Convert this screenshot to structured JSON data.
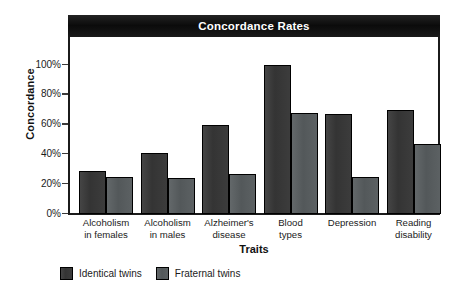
{
  "chart_data": {
    "type": "bar",
    "title": "Concordance Rates",
    "xlabel": "Traits",
    "ylabel": "Concordance",
    "categories": [
      "Alcoholism\nin females",
      "Alcoholism\nin males",
      "Alzheimer's\ndisease",
      "Blood\ntypes",
      "Depression",
      "Reading\ndisability"
    ],
    "category_lines": [
      [
        "Alcoholism",
        "in females"
      ],
      [
        "Alcoholism",
        "in males"
      ],
      [
        "Alzheimer's",
        "disease"
      ],
      [
        "Blood",
        "types"
      ],
      [
        "Depression",
        ""
      ],
      [
        "Reading",
        "disability"
      ]
    ],
    "series": [
      {
        "name": "Identical twins",
        "color": "#3a3a3a",
        "values": [
          29,
          41,
          60,
          100,
          67,
          70
        ]
      },
      {
        "name": "Fraternal twins",
        "color": "#5a5f61",
        "values": [
          25,
          24,
          27,
          68,
          25,
          47
        ]
      }
    ],
    "ylim": [
      0,
      100
    ],
    "ytick_values": [
      100,
      80,
      60,
      40,
      20,
      0
    ],
    "ytick_labels": [
      "100%",
      "80%",
      "60%",
      "40%",
      "20%",
      "0%"
    ],
    "grid": false,
    "legend_position": "bottom-left",
    "value_unit": "%"
  },
  "legend": [
    {
      "label": "Identical twins",
      "color": "#3a3a3a"
    },
    {
      "label": "Fraternal twins",
      "color": "#5a5f61"
    }
  ],
  "colors": {
    "title_bar_background": "#111111",
    "title_text": "#ffffff",
    "axis": "#1b1b1b",
    "identical_twins": "#3a3a3a",
    "fraternal_twins": "#5a5f61",
    "plot_background": "#ffffff"
  }
}
